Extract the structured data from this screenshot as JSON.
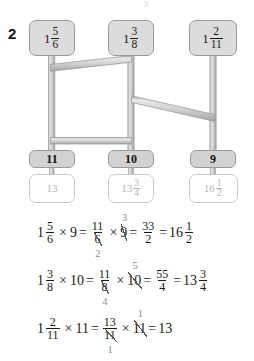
{
  "page": {
    "question_number": "2",
    "bleed_mark": "3"
  },
  "diagram": {
    "top_nodes": [
      {
        "name": "top-node-1",
        "whole": "1",
        "num": "5",
        "den": "6"
      },
      {
        "name": "top-node-2",
        "whole": "1",
        "num": "3",
        "den": "8"
      },
      {
        "name": "top-node-3",
        "whole": "1",
        "num": "2",
        "den": "11"
      }
    ],
    "mid_nodes": [
      {
        "name": "mid-node-1",
        "label": "11"
      },
      {
        "name": "mid-node-2",
        "label": "10"
      },
      {
        "name": "mid-node-3",
        "label": "9"
      }
    ],
    "answer_nodes": [
      {
        "name": "answer-node-1",
        "whole": "13",
        "num": "",
        "den": ""
      },
      {
        "name": "answer-node-2",
        "whole": "13",
        "num": "3",
        "den": "4"
      },
      {
        "name": "answer-node-3",
        "whole": "16",
        "num": "1",
        "den": "2"
      }
    ],
    "colors": {
      "node_fill": "#dcdcdc",
      "mid_fill": "#d2d2d2",
      "node_border": "#9a9a9a",
      "answer_border": "#c9c9c9",
      "answer_text": "#b4b4b4",
      "pipe_fill": "#d5d5d5",
      "pipe_edge": "#9d9d9d",
      "dash_color": "#a8a8a8"
    }
  },
  "equations": [
    {
      "name": "equation-1",
      "mixed": {
        "whole": "1",
        "num": "5",
        "den": "6"
      },
      "times1": "×",
      "factor1": "9",
      "eq1": "=",
      "improper": {
        "num": "11",
        "den": "6"
      },
      "den_cancel": "2",
      "times2": "×",
      "factor2": "9",
      "factor2_cancel": "3",
      "eq2": "=",
      "product": {
        "num": "33",
        "den": "2"
      },
      "eq3": "=",
      "result": {
        "whole": "16",
        "num": "1",
        "den": "2"
      }
    },
    {
      "name": "equation-2",
      "mixed": {
        "whole": "1",
        "num": "3",
        "den": "8"
      },
      "times1": "×",
      "factor1": "10",
      "eq1": "=",
      "improper": {
        "num": "11",
        "den": "8"
      },
      "den_cancel": "4",
      "times2": "×",
      "factor2": "10",
      "factor2_cancel": "5",
      "eq2": "=",
      "product": {
        "num": "55",
        "den": "4"
      },
      "eq3": "=",
      "result": {
        "whole": "13",
        "num": "3",
        "den": "4"
      }
    },
    {
      "name": "equation-3",
      "mixed": {
        "whole": "1",
        "num": "2",
        "den": "11"
      },
      "times1": "×",
      "factor1": "11",
      "eq1": "=",
      "improper": {
        "num": "13",
        "den": "11"
      },
      "den_cancel": "1",
      "times2": "×",
      "factor2": "11",
      "factor2_cancel": "1",
      "eq2": "=",
      "product": null,
      "eq3": "",
      "result": {
        "whole": "13",
        "num": "",
        "den": ""
      }
    }
  ]
}
